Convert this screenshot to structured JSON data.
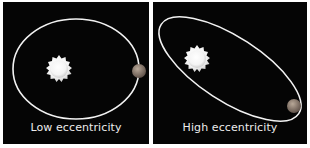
{
  "panels": [
    {
      "id": "low",
      "caption": "Low eccentricity",
      "orbit": {
        "cx": 73,
        "cy": 67,
        "rx": 63,
        "ry": 50,
        "rotate": 0
      },
      "star": {
        "cx": 56,
        "cy": 68,
        "r": 13
      },
      "planet": {
        "cx": 136,
        "cy": 69,
        "r": 7
      }
    },
    {
      "id": "high",
      "caption": "High eccentricity",
      "orbit": {
        "cx": 77,
        "cy": 67,
        "rx": 82,
        "ry": 32,
        "rotate": 33
      },
      "star": {
        "cx": 44,
        "cy": 58,
        "r": 13
      },
      "planet": {
        "cx": 141,
        "cy": 104,
        "r": 7
      }
    }
  ],
  "colors": {
    "background": "#050505",
    "orbit": "#f2f2f2",
    "star_core": "#ffffff",
    "star_edge": "#cfcfcf",
    "planet_light": "#b8a898",
    "planet_dark": "#5a4c44",
    "caption": "#ececec"
  }
}
